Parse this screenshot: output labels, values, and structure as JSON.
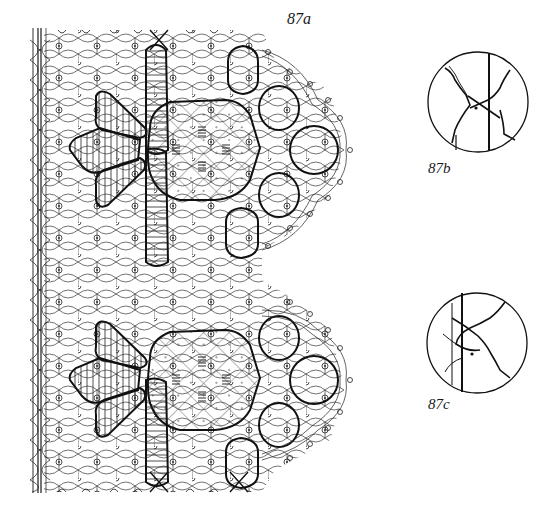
{
  "figure": {
    "labels": {
      "main": "87a",
      "detail_top": "87b",
      "detail_bottom": "87c"
    },
    "colors": {
      "ink": "#1a1a1a",
      "paper": "#ffffff"
    },
    "main_pattern": {
      "description": "Bobbin lace pricking/working diagram with ground net, two hexagonal cloth-stitch motifs with petal tapes, and scalloped headside of rings",
      "motifs": 2
    },
    "details": [
      {
        "label": "87b",
        "description": "Circular detail of crossing twisted pairs with pin dot"
      },
      {
        "label": "87c",
        "description": "Circular detail of crossing twisted pairs with pin dot"
      }
    ]
  }
}
